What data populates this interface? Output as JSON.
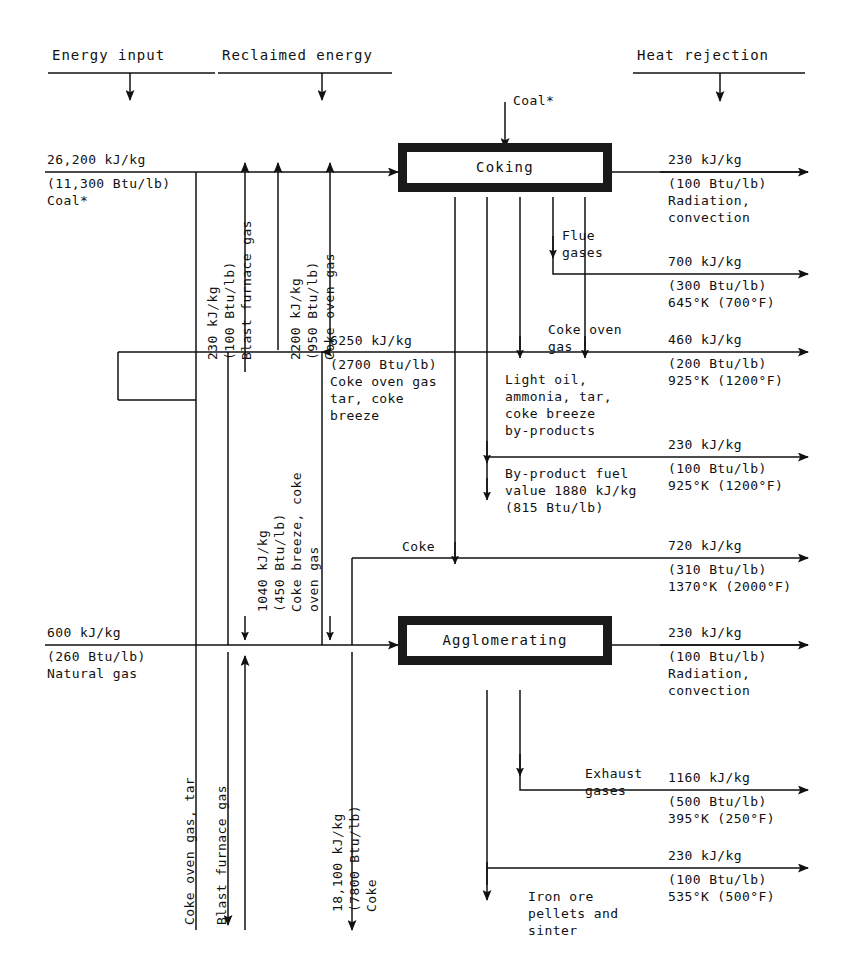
{
  "diagram": {
    "headers": [
      {
        "id": "energy-input",
        "label": "Energy input"
      },
      {
        "id": "reclaimed-energy",
        "label": "Reclaimed energy"
      },
      {
        "id": "heat-rejection",
        "label": "Heat rejection"
      }
    ],
    "processes": [
      {
        "id": "coking",
        "label": "Coking"
      },
      {
        "id": "agglomerating",
        "label": "Agglomerating"
      }
    ],
    "inputs": [
      {
        "id": "coal-input",
        "line1": "26,200 kJ/kg",
        "line2": "(11,300 Btu/lb)",
        "line3": "Coal*"
      },
      {
        "id": "natural-gas-input",
        "line1": "600 kJ/kg",
        "line2": "(260 Btu/lb)",
        "line3": "Natural gas"
      }
    ],
    "top_feed": {
      "id": "coal-feed",
      "label": "Coal*"
    },
    "reclaimed": [
      {
        "id": "blast-furnace-gas-reclaim",
        "l1": "230 kJ/kg",
        "l2": "(100 Btu/lb)",
        "l3": "Blast furnace gas"
      },
      {
        "id": "coke-oven-gas-reclaim",
        "l1": "2200 kJ/kg",
        "l2": "(950 Btu/lb)",
        "l3": "Coke oven gas"
      },
      {
        "id": "coke-breeze-reclaim",
        "l1": "1040 kJ/kg",
        "l2": "(450 Btu/lb)",
        "l3": "Coke breeze, coke",
        "l4": "oven gas"
      }
    ],
    "byproduct_stream": {
      "id": "coke-oven-gas-tar-stream",
      "l1": "6250 kJ/kg",
      "l2": "(2700 Btu/lb)",
      "l3": "Coke oven gas",
      "l4": "tar, coke",
      "l5": "breeze"
    },
    "coke_stream": {
      "id": "coke-stream",
      "l1": "18,100 kJ/kg",
      "l2": "(7800 Btu/lb)",
      "l3": "Coke"
    },
    "stream_labels": [
      {
        "id": "flue-gases",
        "l1": "Flue",
        "l2": "gases"
      },
      {
        "id": "coke-oven-gas",
        "l1": "Coke oven",
        "l2": "gas '"
      },
      {
        "id": "light-oil-byproducts",
        "l1": "Light oil,",
        "l2": "ammonia, tar,",
        "l3": "coke breeze",
        "l4": "by-products"
      },
      {
        "id": "byproduct-fuel-value",
        "l1": "By-product fuel",
        "l2": "value 1880 kJ/kg",
        "l3": "(815 Btu/lb)"
      },
      {
        "id": "coke-label",
        "l1": "Coke"
      },
      {
        "id": "exhaust-gases",
        "l1": "Exhaust",
        "l2": "gases"
      },
      {
        "id": "iron-ore-output",
        "l1": "Iron ore",
        "l2": "pellets and",
        "l3": "sinter"
      },
      {
        "id": "coke-oven-gas-tar-down",
        "l1": "Coke oven gas, tar"
      },
      {
        "id": "blast-furnace-gas-up",
        "l1": "Blast furnace gas"
      }
    ],
    "rejections": [
      {
        "id": "rej-1",
        "top": "230 kJ/kg",
        "b1": "(100 Btu/lb)",
        "b2": "Radiation,",
        "b3": "convection"
      },
      {
        "id": "rej-2",
        "top": "700 kJ/kg",
        "b1": "(300 Btu/lb)",
        "b2": "645°K (700°F)",
        "b3": ""
      },
      {
        "id": "rej-3",
        "top": "460 kJ/kg",
        "b1": "(200 Btu/lb)",
        "b2": "925°K (1200°F)",
        "b3": ""
      },
      {
        "id": "rej-4",
        "top": "230 kJ/kg",
        "b1": "(100 Btu/lb)",
        "b2": "925°K (1200°F)",
        "b3": ""
      },
      {
        "id": "rej-5",
        "top": "720 kJ/kg",
        "b1": "(310 Btu/lb)",
        "b2": "1370°K (2000°F)",
        "b3": ""
      },
      {
        "id": "rej-6",
        "top": "230 kJ/kg",
        "b1": "(100 Btu/lb)",
        "b2": "Radiation,",
        "b3": "convection"
      },
      {
        "id": "rej-7",
        "top": "1160 kJ/kg",
        "b1": "(500 Btu/lb)",
        "b2": "395°K (250°F)",
        "b3": ""
      },
      {
        "id": "rej-8",
        "top": "230 kJ/kg",
        "b1": "(100 Btu/lb)",
        "b2": "535°K (500°F)",
        "b3": ""
      }
    ]
  }
}
